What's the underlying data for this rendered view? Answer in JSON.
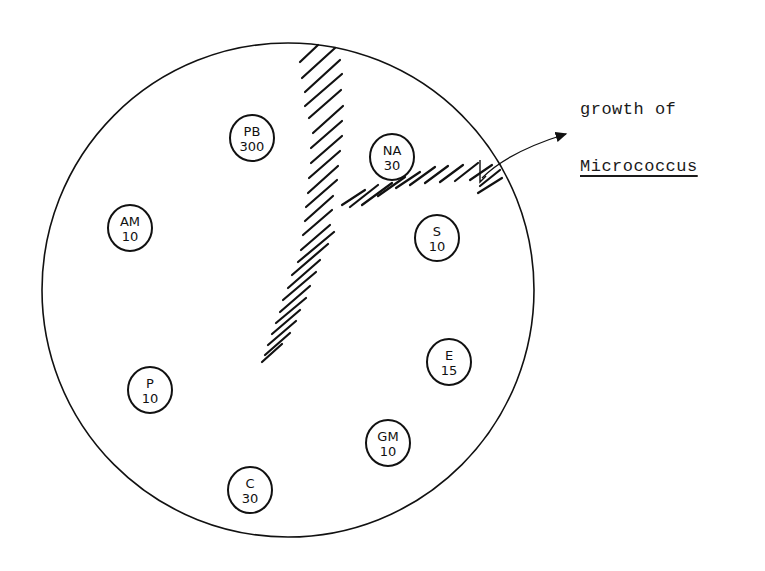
{
  "annotation": {
    "line1": "growth of",
    "line2": "Micrococcus"
  },
  "plate": {
    "disks": [
      {
        "code": "PB",
        "value": "300",
        "cx": 252,
        "cy": 138
      },
      {
        "code": "NA",
        "value": "30",
        "cx": 392,
        "cy": 157
      },
      {
        "code": "AM",
        "value": "10",
        "cx": 130,
        "cy": 228
      },
      {
        "code": "S",
        "value": "10",
        "cx": 437,
        "cy": 238
      },
      {
        "code": "E",
        "value": "15",
        "cx": 449,
        "cy": 362
      },
      {
        "code": "P",
        "value": "10",
        "cx": 150,
        "cy": 390
      },
      {
        "code": "GM",
        "value": "10",
        "cx": 388,
        "cy": 443
      },
      {
        "code": "C",
        "value": "30",
        "cx": 250,
        "cy": 490
      }
    ]
  },
  "colors": {
    "ink": "#111111",
    "background": "#ffffff"
  }
}
